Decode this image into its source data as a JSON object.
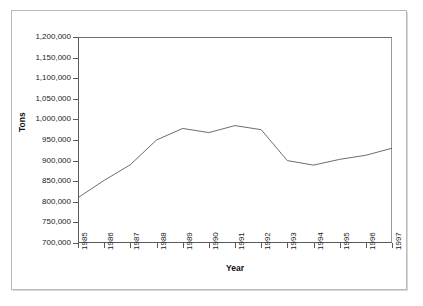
{
  "chart_data": {
    "type": "line",
    "title": "",
    "subtitle": "",
    "xlabel": "Year",
    "ylabel": "Tons",
    "categories": [
      "1985",
      "1986",
      "1987",
      "1988",
      "1989",
      "1990",
      "1991",
      "1992",
      "1993",
      "1994",
      "1995",
      "1996",
      "1997"
    ],
    "x": [
      1985,
      1986,
      1987,
      1988,
      1989,
      1990,
      1991,
      1992,
      1993,
      1994,
      1995,
      1996,
      1997
    ],
    "values": [
      810000,
      852000,
      890000,
      950000,
      978000,
      968000,
      985000,
      975000,
      900000,
      889000,
      903000,
      913000,
      930000
    ],
    "series": [
      {
        "name": "Tons",
        "values": [
          810000,
          852000,
          890000,
          950000,
          978000,
          968000,
          985000,
          975000,
          900000,
          889000,
          903000,
          913000,
          930000
        ],
        "color": "#5c5c5c",
        "marker": "none"
      }
    ],
    "ylim": [
      700000,
      1200000
    ],
    "ytick_step": 50000,
    "ytick_labels": [
      "1,200,000",
      "1,150,000",
      "1,100,000",
      "1,050,000",
      "1,000,000",
      "950,000",
      "900,000",
      "850,000",
      "800,000",
      "750,000",
      "700,000"
    ],
    "ytick_values": [
      1200000,
      1150000,
      1100000,
      1050000,
      1000000,
      950000,
      900000,
      850000,
      800000,
      750000,
      700000
    ],
    "xtick_labels": [
      "1985",
      "1986",
      "1987",
      "1988",
      "1989",
      "1990",
      "1991",
      "1992",
      "1993",
      "1994",
      "1995",
      "1996",
      "1997"
    ],
    "xtick_rotation": -90,
    "grid": false,
    "legend": false,
    "legend_position": "none",
    "annotations": []
  },
  "axes": {
    "y_title": "Tons",
    "x_title": "Year"
  },
  "colors": {
    "line": "#5c5c5c",
    "axis": "#5a5a5a",
    "frame": "#b9b9b9",
    "text": "#1a1a1a",
    "background": "#ffffff"
  }
}
